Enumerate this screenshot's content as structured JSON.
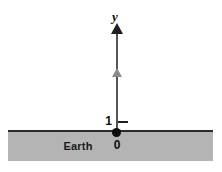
{
  "figure": {
    "title": "",
    "background_color": "#ffffff",
    "width": 222,
    "height": 172
  },
  "axis": {
    "name": "vertical-axis",
    "label": "y",
    "arrow_direction": "up",
    "color": "#555555",
    "arrowhead_color": "#1f1f1f"
  },
  "ticks": [
    {
      "label": "1",
      "position": "above-origin",
      "color": "#1f1f1f"
    }
  ],
  "origin": {
    "label": "0",
    "marker": "filled-dot",
    "color": "#0d0d0d"
  },
  "marker": {
    "name": "velocity-arrow",
    "shape": "triangle-up",
    "color": "#8a8a8a"
  },
  "ground": {
    "label": "Earth",
    "fill_color": "#b4b4b4",
    "surface_line_color": "#2b2b2b"
  }
}
